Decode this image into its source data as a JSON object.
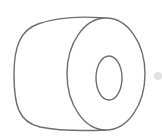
{
  "image": {
    "subject": "roll-icon",
    "description": "Line drawing of a cylindrical roll (e.g. tape or toilet paper roll) viewed from the front-right, with an inner hole",
    "colors": {
      "background": "#ffffff",
      "stroke": "#6e6e6e",
      "dot": "#e2e2e2"
    }
  }
}
